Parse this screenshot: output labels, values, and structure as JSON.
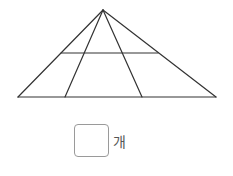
{
  "figure": {
    "stroke_color": "#333333",
    "apex": [
      103,
      10
    ],
    "base_left": [
      18,
      97
    ],
    "base_right": [
      216,
      97
    ],
    "inner_base_points": [
      [
        65,
        97
      ],
      [
        142,
        97
      ]
    ],
    "horizontal_line": {
      "y": 53,
      "x1": 61,
      "x2": 158
    }
  },
  "answer": {
    "value": "",
    "unit": "개"
  }
}
